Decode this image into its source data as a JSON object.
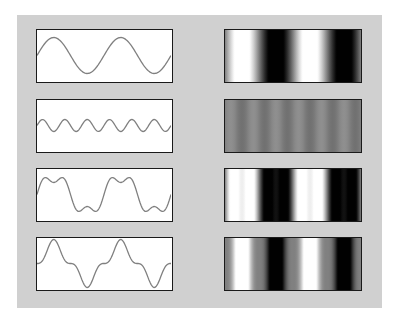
{
  "figure": {
    "background_color": "#d0d0d0",
    "line_color": "#808080",
    "rows": [
      {
        "id": "fundamental",
        "components": [
          {
            "freq": 2,
            "amp": 1.0
          }
        ],
        "label": "sin(f)"
      },
      {
        "id": "third-harmonic",
        "components": [
          {
            "freq": 6,
            "amp": 0.333
          }
        ],
        "label": "1/3 sin(3f)"
      },
      {
        "id": "sum",
        "components": [
          {
            "freq": 2,
            "amp": 1.0
          },
          {
            "freq": 6,
            "amp": 0.333
          }
        ],
        "label": "sin(f) + 1/3 sin(3f)"
      },
      {
        "id": "difference",
        "components": [
          {
            "freq": 2,
            "amp": 1.0
          },
          {
            "freq": 6,
            "amp": -0.333
          }
        ],
        "label": "sin(f) - 1/3 sin(3f)"
      }
    ]
  }
}
